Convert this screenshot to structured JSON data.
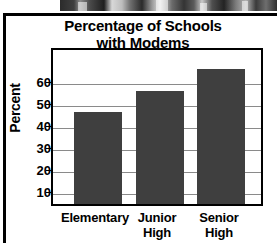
{
  "chart_data": {
    "type": "bar",
    "title": "Percentage of Schools with Modems",
    "title_line1": "Percentage of Schools",
    "title_line2": "with Modems",
    "xlabel": "",
    "ylabel": "Percent",
    "categories": [
      "Elementary",
      "Junior High",
      "Senior High"
    ],
    "category_lines": [
      [
        "Elementary"
      ],
      [
        "Junior",
        "High"
      ],
      [
        "Senior",
        "High"
      ]
    ],
    "values": [
      43,
      53,
      63
    ],
    "ylim": [
      0,
      72
    ],
    "yticks": [
      10,
      20,
      30,
      40,
      50,
      60
    ],
    "ytick_labels": [
      "10",
      "20",
      "30",
      "40",
      "50",
      "60"
    ],
    "grid": true,
    "grid_axis": "y",
    "legend": false,
    "bar_color": "#3f3f3f",
    "grid_color": "#8a8a8a",
    "axis_color": "#000000",
    "background_color": "#ffffff"
  }
}
